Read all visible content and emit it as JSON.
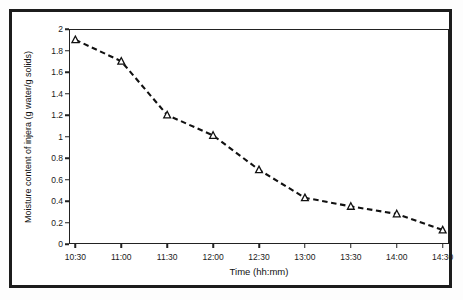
{
  "figure": {
    "background_color": "#ffffff",
    "frame_color": "#1c1c1c",
    "axis_color": "#222222",
    "series_color": "#111111"
  },
  "chart_data": {
    "type": "line",
    "title": "",
    "subtitle": "",
    "xlabel": "Time (hh:mm)",
    "ylabel": "Moisture content of injera  (g water/g solids)",
    "categories": [
      "10:30",
      "11:00",
      "11:30",
      "12:00",
      "12:30",
      "13:00",
      "13:30",
      "14:00",
      "14:30"
    ],
    "values": [
      1.9,
      1.7,
      1.2,
      1.01,
      0.69,
      0.43,
      0.35,
      0.28,
      0.13
    ],
    "series": [
      {
        "name": "Moisture content of injera",
        "values": [
          1.9,
          1.7,
          1.2,
          1.01,
          0.69,
          0.43,
          0.35,
          0.28,
          0.13
        ],
        "line_style": "dashed",
        "marker": "open-triangle",
        "color": "#111111"
      }
    ],
    "ylim": [
      0,
      2
    ],
    "ytick_values": [
      0,
      0.2,
      0.4,
      0.6,
      0.8,
      1,
      1.2,
      1.4,
      1.6,
      1.8,
      2
    ],
    "ytick_labels": [
      "0",
      "0.2",
      "0.4",
      "0.6",
      "0.8",
      "1",
      "1.2",
      "1.4",
      "1.6",
      "1.8",
      "2"
    ],
    "xtick_labels": [
      "10:30",
      "11:00",
      "11:30",
      "12:00",
      "12:30",
      "13:00",
      "13:30",
      "14:00",
      "14:30"
    ],
    "grid": false,
    "legend": false,
    "legend_position": "none"
  }
}
